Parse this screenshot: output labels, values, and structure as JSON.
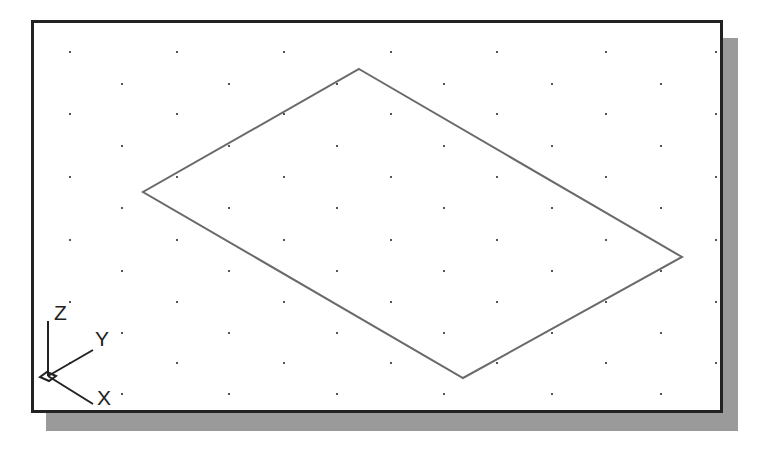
{
  "viewport": {
    "background": "#ffffff",
    "border_color": "#222222",
    "shadow_color": "#9a9a9a"
  },
  "grid": {
    "dot_color": "#555555",
    "rows_y": [
      52,
      84,
      114,
      146,
      177,
      208,
      240,
      271,
      302,
      333,
      363,
      394
    ],
    "even_cols_x": [
      70,
      177,
      284,
      391,
      497,
      606,
      716
    ],
    "odd_cols_x": [
      122,
      229,
      337,
      444,
      552,
      661
    ]
  },
  "shape": {
    "type": "isometric-rectangle",
    "stroke": "#6a6a6a",
    "vertices": [
      [
        359,
        69
      ],
      [
        682,
        257
      ],
      [
        463,
        378
      ],
      [
        143,
        192
      ]
    ]
  },
  "ucs_icon": {
    "origin": [
      48,
      376
    ],
    "z_label": "Z",
    "y_label": "Y",
    "x_label": "X"
  }
}
